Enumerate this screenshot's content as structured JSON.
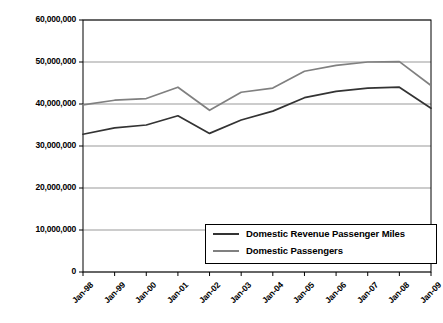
{
  "chart_data": {
    "type": "line",
    "title": "",
    "xlabel": "",
    "ylabel": "",
    "grid": true,
    "legend_position": "inside-bottom-right",
    "categories": [
      "Jan-98",
      "Jan-99",
      "Jan-00",
      "Jan-01",
      "Jan-02",
      "Jan-03",
      "Jan-04",
      "Jan-05",
      "Jan-06",
      "Jan-07",
      "Jan-08",
      "Jan-09"
    ],
    "ylim": [
      0,
      60000000
    ],
    "yticks": [
      0,
      10000000,
      20000000,
      30000000,
      40000000,
      50000000,
      60000000
    ],
    "ytick_labels": [
      "0",
      "10,000,000",
      "20,000,000",
      "30,000,000",
      "40,000,000",
      "50,000,000",
      "60,000,000"
    ],
    "series": [
      {
        "name": "Domestic Revenue Passenger Miles",
        "color": "#333333",
        "values": [
          32800000,
          34300000,
          35000000,
          37200000,
          33000000,
          36200000,
          38300000,
          41500000,
          43000000,
          43800000,
          44000000,
          39000000
        ]
      },
      {
        "name": "Domestic Passengers",
        "color": "#808080",
        "values": [
          39800000,
          40900000,
          41300000,
          44000000,
          38500000,
          42800000,
          43800000,
          47800000,
          49200000,
          50000000,
          50100000,
          44400000
        ]
      }
    ]
  },
  "axes": {
    "border_color": "#000000",
    "gridline_color": "#999999"
  }
}
